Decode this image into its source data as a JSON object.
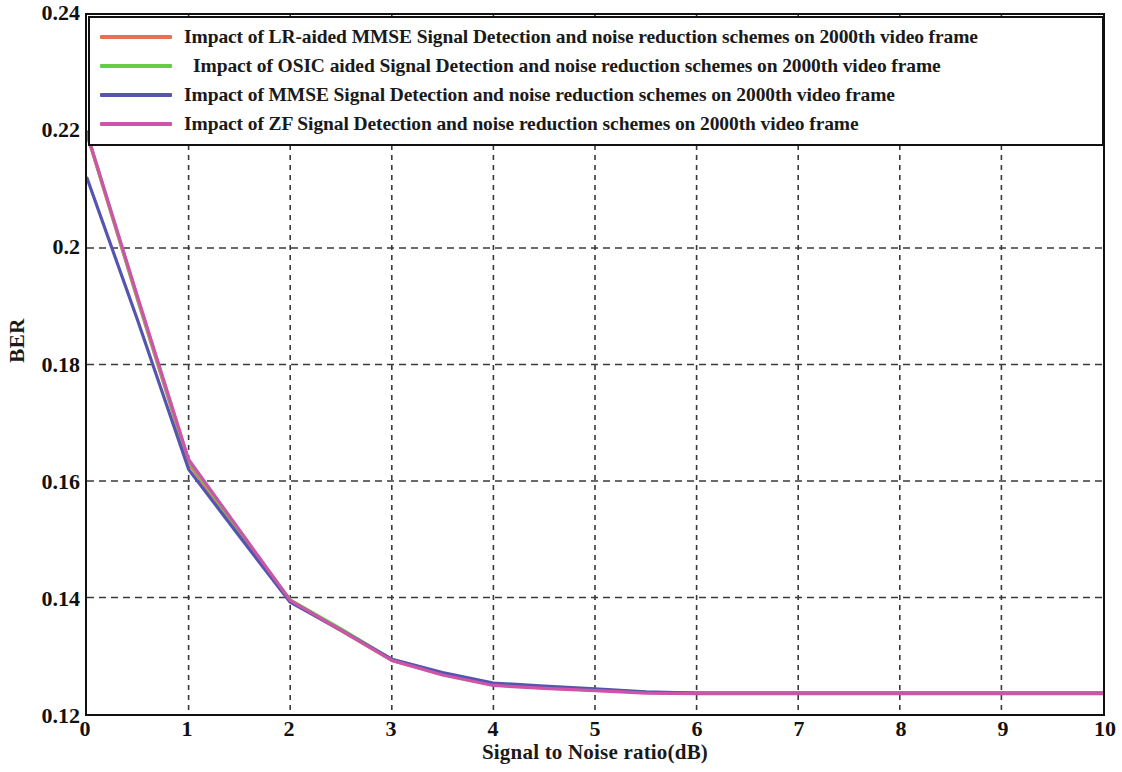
{
  "chart_data": {
    "type": "line",
    "title": "",
    "xlabel": "Signal to Noise ratio(dB)",
    "ylabel": "BER",
    "xlim": [
      0,
      10
    ],
    "ylim": [
      0.12,
      0.24
    ],
    "xticks": [
      "0",
      "1",
      "2",
      "3",
      "4",
      "5",
      "6",
      "7",
      "8",
      "9",
      "10"
    ],
    "yticks": [
      "0.24",
      "0.22",
      "0.2",
      "0.18",
      "0.16",
      "0.14",
      "0.12"
    ],
    "grid": true,
    "legend_position": "upper-center-inside",
    "x": [
      0,
      0.5,
      1,
      1.5,
      2,
      2.5,
      3,
      3.5,
      4,
      4.5,
      5,
      5.5,
      6,
      6.5,
      7,
      7.5,
      8,
      8.5,
      9,
      9.5,
      10
    ],
    "series": [
      {
        "name": "Impact of LR-aided MMSE Signal Detection  and noise reduction schemes on 2000th  video frame",
        "color": "#e8705a",
        "values": [
          0.2195,
          0.191,
          0.163,
          0.151,
          0.1393,
          0.1343,
          0.1292,
          0.1268,
          0.125,
          0.1245,
          0.1241,
          0.1237,
          0.1236,
          0.1236,
          0.1236,
          0.1236,
          0.1236,
          0.1236,
          0.1236,
          0.1236,
          0.1236
        ]
      },
      {
        "name": "Impact of OSIC aided Signal Detection  and noise reduction schemes on 2000th  video frame",
        "color": "#66cc44",
        "values": [
          0.2196,
          0.1912,
          0.1634,
          0.1513,
          0.1396,
          0.1346,
          0.1294,
          0.127,
          0.1251,
          0.1246,
          0.1242,
          0.1237,
          0.1236,
          0.1236,
          0.1236,
          0.1236,
          0.1236,
          0.1236,
          0.1236,
          0.1236,
          0.1236
        ]
      },
      {
        "name": "Impact of  MMSE Signal Detection  and noise reduction schemes on 2000th  video frame",
        "color": "#5555b0",
        "values": [
          0.212,
          0.1875,
          0.162,
          0.1505,
          0.1392,
          0.1344,
          0.1294,
          0.1271,
          0.1253,
          0.1248,
          0.1243,
          0.1238,
          0.1236,
          0.1236,
          0.1236,
          0.1236,
          0.1236,
          0.1236,
          0.1236,
          0.1236,
          0.1236
        ]
      },
      {
        "name": "Impact of  ZF Signal Detection  and noise reduction schemes on 2000th  video frame",
        "color": "#cc55aa",
        "values": [
          0.2197,
          0.1915,
          0.1637,
          0.1516,
          0.1395,
          0.1344,
          0.1292,
          0.1267,
          0.1249,
          0.1244,
          0.124,
          0.1236,
          0.1235,
          0.1235,
          0.1235,
          0.1235,
          0.1235,
          0.1235,
          0.1235,
          0.1235,
          0.1235
        ]
      }
    ]
  },
  "axes": {
    "ylabel": "BER",
    "xlabel": "Signal to Noise ratio(dB)"
  },
  "legend": {
    "items": [
      {
        "label": "Impact of LR-aided MMSE Signal Detection  and noise reduction schemes on 2000th  video frame",
        "color": "#e8705a"
      },
      {
        "label": "Impact of OSIC aided Signal Detection  and noise reduction schemes on 2000th  video frame",
        "color": "#66cc44"
      },
      {
        "label": "Impact of  MMSE Signal Detection  and noise reduction schemes on 2000th  video frame",
        "color": "#5555b0"
      },
      {
        "label": "Impact of  ZF Signal Detection  and noise reduction schemes on 2000th  video frame",
        "color": "#cc55aa"
      }
    ]
  },
  "colors": {
    "grid": "#3a3a3a",
    "frame": "#111111",
    "background": "#ffffff"
  }
}
